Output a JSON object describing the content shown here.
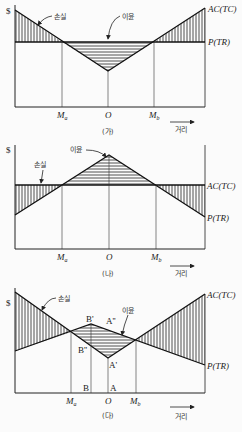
{
  "figure": {
    "panels": [
      {
        "id": "ga",
        "caption": "(가)",
        "y_label": "$",
        "x_axis_label": "거리",
        "curve_ac_label": "AC(TC)",
        "curve_p_label": "P(TR)",
        "loss_label": "손실",
        "profit_label": "이윤",
        "ticks": [
          "Ma",
          "O",
          "Mb"
        ]
      },
      {
        "id": "na",
        "caption": "(나)",
        "y_label": "$",
        "x_axis_label": "거리",
        "curve_ac_label": "AC(TC)",
        "curve_p_label": "P(TR)",
        "loss_label": "손실",
        "profit_label": "이윤",
        "ticks": [
          "Ma",
          "O",
          "Mb"
        ]
      },
      {
        "id": "da",
        "caption": "(다)",
        "y_label": "$",
        "x_axis_label": "거리",
        "curve_ac_label": "AC(TC)",
        "curve_p_label": "P(TR)",
        "loss_label": "손실",
        "profit_label": "이윤",
        "ticks": [
          "Ma",
          "O",
          "Mb"
        ],
        "points": [
          "B'",
          "B''",
          "A'",
          "A''",
          "B",
          "A"
        ]
      }
    ]
  }
}
